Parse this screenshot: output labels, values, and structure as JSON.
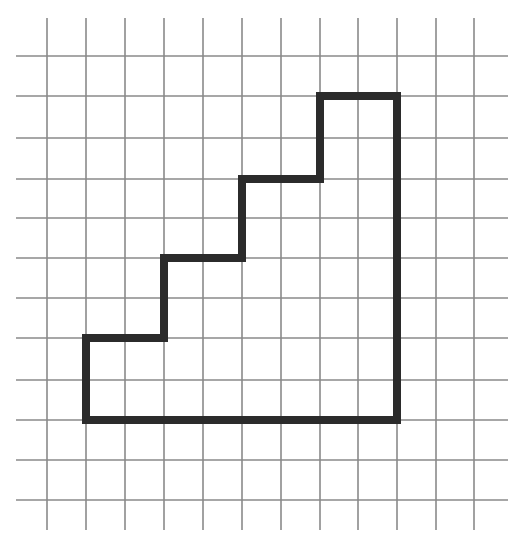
{
  "diagram": {
    "type": "grid-polygon",
    "colors": {
      "background": "#ffffff",
      "grid_line": "#8a8a8a",
      "polygon_stroke": "#2b2b2b"
    },
    "grid": {
      "x_lines": [
        47,
        86,
        125,
        164,
        203,
        242,
        281,
        320,
        358,
        397,
        436,
        474
      ],
      "y_lines": [
        56,
        96,
        138,
        179,
        218,
        258,
        298,
        338,
        380,
        420,
        460,
        500
      ],
      "x_extent": [
        16,
        508
      ],
      "y_extent": [
        18,
        530
      ],
      "columns": 11,
      "rows": 11
    },
    "polygon": {
      "grid_vertices": [
        [
          1,
          7
        ],
        [
          3,
          7
        ],
        [
          3,
          5
        ],
        [
          5,
          5
        ],
        [
          5,
          3
        ],
        [
          7,
          3
        ],
        [
          7,
          1
        ],
        [
          9,
          1
        ],
        [
          9,
          9
        ],
        [
          1,
          9
        ]
      ],
      "pixel_vertices": [
        [
          86,
          338
        ],
        [
          164,
          338
        ],
        [
          164,
          258
        ],
        [
          242,
          258
        ],
        [
          242,
          179
        ],
        [
          320,
          179
        ],
        [
          320,
          96
        ],
        [
          397,
          96
        ],
        [
          397,
          420
        ],
        [
          86,
          420
        ]
      ],
      "stroke_width": 8,
      "steps": 3,
      "width_cells": 8,
      "height_cells": 8
    }
  }
}
